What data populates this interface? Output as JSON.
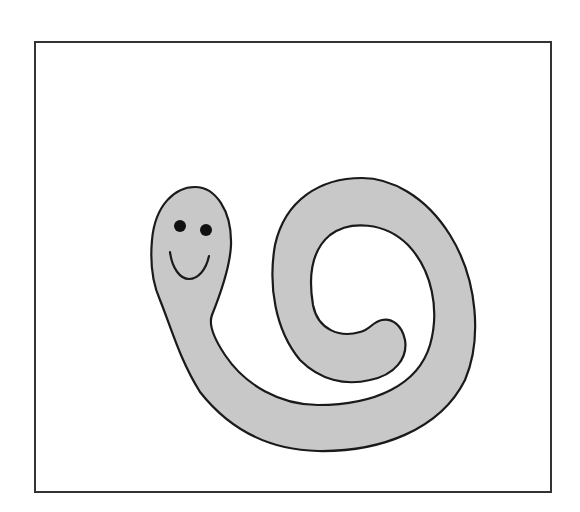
{
  "figure": {
    "colors": {
      "background": "#ffffff",
      "frame": "#333333",
      "body_fill": "#c8c8c8",
      "outline": "#1a1a1a",
      "eyes": "#111111"
    },
    "parts": [
      "frame",
      "worm-body",
      "left-eye",
      "right-eye",
      "smile"
    ]
  }
}
